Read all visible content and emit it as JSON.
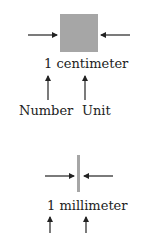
{
  "top": {
    "measure_label": "1 centimeter",
    "number_label": "Number",
    "unit_label": "Unit",
    "shape_color": "#a6a6a6"
  },
  "bottom": {
    "measure_label": "1 millimeter",
    "shape_color": "#a6a6a6"
  },
  "arrow_color": "#222222"
}
